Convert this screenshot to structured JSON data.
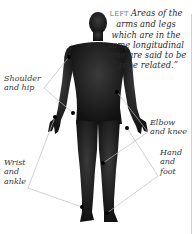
{
  "caption": {
    "tag": "LEFT",
    "text": "Areas of the arms and legs which are in the same longitudinal zone are said to be “zone related.”"
  },
  "labels": {
    "shoulder_hip": [
      "Shoulder",
      "and hip"
    ],
    "wrist_ankle": [
      "Wrist",
      "and",
      "ankle"
    ],
    "elbow_knee": [
      "Elbow",
      "and knee"
    ],
    "hand_foot": [
      "Hand",
      "and",
      "foot"
    ]
  },
  "colors": {
    "silhouette": "#1c1c1c",
    "connector": "#b9b9b9",
    "dot": "#000000",
    "text": "#2a2a2a"
  },
  "points": {
    "shoulder": [
      69,
      57
    ],
    "hip": [
      73,
      113
    ],
    "wrist": [
      55,
      117
    ],
    "ankle": [
      82,
      207
    ],
    "elbow": [
      117,
      92
    ],
    "knee": [
      103,
      163
    ],
    "hand": [
      127,
      128
    ],
    "foot": [
      107,
      213
    ]
  }
}
